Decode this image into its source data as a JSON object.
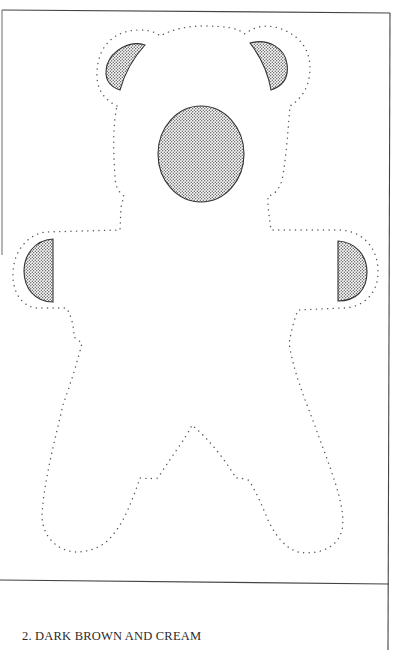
{
  "document": {
    "type": "sewing-pattern-page",
    "caption": "2. DARK BROWN AND CREAM"
  },
  "pattern": {
    "subject": "teddy bear",
    "outline_style": "dotted cutting line",
    "pieces": [
      {
        "name": "body-outline",
        "style": "dotted"
      },
      {
        "name": "left-ear-patch",
        "style": "stippled fill"
      },
      {
        "name": "right-ear-patch",
        "style": "stippled fill"
      },
      {
        "name": "face-oval-patch",
        "style": "stippled fill"
      },
      {
        "name": "left-paw-patch",
        "style": "stippled fill, half-disc"
      },
      {
        "name": "right-paw-patch",
        "style": "stippled fill, half-disc"
      }
    ]
  },
  "colors": {
    "ink": "#3a3a3a",
    "dots": "#555555",
    "frame": "#444444",
    "paper": "#ffffff"
  }
}
